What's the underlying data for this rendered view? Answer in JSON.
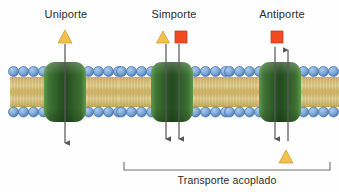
{
  "figure": {
    "title_text": "",
    "background_color": "#fefefe",
    "caption": "Transporte acoplado",
    "language": "es"
  },
  "panels": [
    {
      "id": "uniporte",
      "label": "Uniporte",
      "center_x": 65,
      "solutes_top": [
        {
          "shape": "triangle",
          "color": "#f2c14b",
          "x": 65,
          "y": 38
        }
      ],
      "solutes_bottom": [],
      "arrows": [
        {
          "direction": "down",
          "x": 65,
          "y_start": 44,
          "y_end": 146
        }
      ],
      "membrane": {
        "x_left": 10,
        "x_right": 122,
        "y_top": 66,
        "y_bottom": 117
      },
      "protein": {
        "x": 44,
        "width": 42,
        "y_top": 62,
        "height": 60,
        "color": "#2d5a27"
      }
    },
    {
      "id": "simporte",
      "label": "Simporte",
      "center_x": 172,
      "solutes_top": [
        {
          "shape": "triangle",
          "color": "#f2c14b",
          "x": 163,
          "y": 38
        },
        {
          "shape": "square",
          "color": "#ef4a20",
          "x": 181,
          "y": 38
        }
      ],
      "solutes_bottom": [],
      "arrows": [
        {
          "direction": "down",
          "x": 166,
          "y_start": 44,
          "y_end": 143
        },
        {
          "direction": "down",
          "x": 179,
          "y_start": 44,
          "y_end": 143
        }
      ],
      "membrane": {
        "x_left": 118,
        "x_right": 230,
        "y_top": 66,
        "y_bottom": 117
      },
      "protein": {
        "x": 151,
        "width": 42,
        "y_top": 62,
        "height": 60,
        "color": "#2d5a27"
      }
    },
    {
      "id": "antiporte",
      "label": "Antiporte",
      "center_x": 280,
      "solutes_top": [
        {
          "shape": "square",
          "color": "#ef4a20",
          "x": 277,
          "y": 38
        }
      ],
      "solutes_bottom": [
        {
          "shape": "triangle",
          "color": "#f2c14b",
          "x": 286,
          "y": 158
        }
      ],
      "arrows": [
        {
          "direction": "down",
          "x": 275,
          "y_start": 46,
          "y_end": 143
        },
        {
          "direction": "up",
          "x": 288,
          "y_start": 143,
          "y_end": 48
        }
      ],
      "membrane": {
        "x_left": 226,
        "x_right": 338,
        "y_top": 66,
        "y_bottom": 117
      },
      "protein": {
        "x": 259,
        "width": 42,
        "y_top": 62,
        "height": 60,
        "color": "#2d5a27"
      }
    }
  ],
  "bracket": {
    "x_left": 124,
    "x_right": 330,
    "y": 170,
    "tick_height": 8,
    "color": "#6e6e6e",
    "label": "Transporte acoplado"
  },
  "legend_colors": {
    "lipid_head": "#6c9bd2",
    "lipid_head_stroke": "#3f6fa8",
    "lipid_tail": "#d8c378",
    "protein_dark": "#2d5a27",
    "protein_light": "#4e8a3f",
    "solute_triangle": "#f2c14b",
    "solute_square": "#ef4a20",
    "arrow": "#58585a",
    "text": "#2b2b2b"
  },
  "structures": {
    "membrane_name": "phospholipid-bilayer",
    "protein_name": "transport-protein",
    "head_count_per_row": 0
  }
}
